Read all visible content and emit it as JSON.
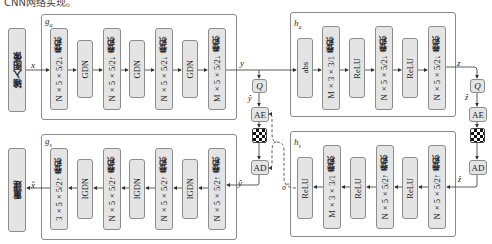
{
  "header_text": "CNN网络实现。",
  "colors": {
    "block_fill": "#e4e4e4",
    "block_border": "#8d8d8d",
    "frame_border": "#8a8a8a",
    "line": "#333333"
  },
  "input_block": {
    "label": "输入图像"
  },
  "output_block": {
    "label": "重建"
  },
  "signals": {
    "x": "x",
    "x_hat": "x̂",
    "y": "y",
    "y_hat": "ŷ",
    "z": "z",
    "z_hat": "ẑ",
    "sigma_hat": "σ̂"
  },
  "g_a": {
    "label": "g",
    "sub": "a",
    "blocks": [
      {
        "type": "conv",
        "cn": "卷积",
        "spec": "N×5×5/2↓"
      },
      {
        "type": "act",
        "label": "GDN"
      },
      {
        "type": "conv",
        "cn": "卷积",
        "spec": "N×5×5/2↓"
      },
      {
        "type": "act",
        "label": "GDN"
      },
      {
        "type": "conv",
        "cn": "卷积",
        "spec": "N×5×5/2↓"
      },
      {
        "type": "act",
        "label": "GDN"
      },
      {
        "type": "conv",
        "cn": "卷积",
        "spec": "M×5×5/2↓"
      }
    ]
  },
  "h_a": {
    "label": "h",
    "sub": "a",
    "blocks": [
      {
        "type": "act",
        "label": "abs"
      },
      {
        "type": "conv",
        "cn": "卷积",
        "spec": "M×3×3/1"
      },
      {
        "type": "act",
        "label": "ReLU"
      },
      {
        "type": "conv",
        "cn": "卷积",
        "spec": "N×5×5/2↓"
      },
      {
        "type": "act",
        "label": "ReLU"
      },
      {
        "type": "conv",
        "cn": "卷积",
        "spec": "N×5×5/2↓"
      }
    ]
  },
  "g_s": {
    "label": "g",
    "sub": "s",
    "blocks": [
      {
        "type": "conv",
        "cn": "卷积",
        "spec": "3×5×5/2↑"
      },
      {
        "type": "act",
        "label": "IGDN"
      },
      {
        "type": "conv",
        "cn": "卷积",
        "spec": "N×5×5/2↑"
      },
      {
        "type": "act",
        "label": "IGDN"
      },
      {
        "type": "conv",
        "cn": "卷积",
        "spec": "N×5×5/2↑"
      },
      {
        "type": "act",
        "label": "IGDN"
      },
      {
        "type": "conv",
        "cn": "卷积",
        "spec": "N×5×5/2↑"
      }
    ]
  },
  "h_s": {
    "label": "h",
    "sub": "s",
    "blocks": [
      {
        "type": "act",
        "label": "ReLU"
      },
      {
        "type": "conv",
        "cn": "卷积",
        "spec": "M×3×3/1"
      },
      {
        "type": "act",
        "label": "ReLU"
      },
      {
        "type": "conv",
        "cn": "卷积",
        "spec": "N×5×5/2↑"
      },
      {
        "type": "act",
        "label": "ReLU"
      },
      {
        "type": "conv",
        "cn": "卷积",
        "spec": "N×5×5/2↑"
      }
    ]
  },
  "entropy_left": {
    "q": "Q",
    "ae": "AE",
    "ad": "AD"
  },
  "entropy_right": {
    "q": "Q",
    "ae": "AE",
    "ad": "AD"
  }
}
